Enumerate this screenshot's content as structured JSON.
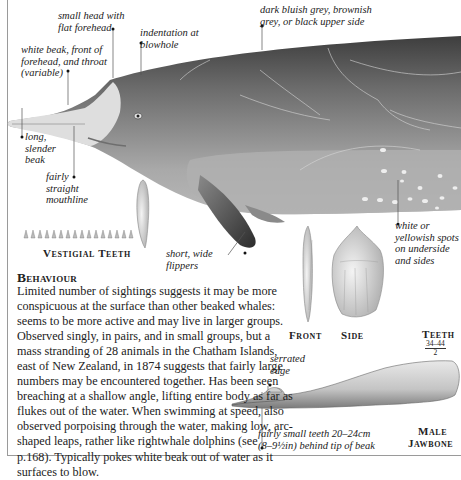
{
  "callouts": {
    "small_head": "small head with\nflat forehead",
    "blowhole": "indentation at\nblowhole",
    "upper_side": "dark bluish grey, brownish\ngrey, or black upper side",
    "white_beak": "white beak, front of\nforehead, and throat\n(variable)",
    "long_beak": "long,\nslender\nbeak",
    "mouthline": "fairly\nstraight\nmouthline",
    "flippers": "short, wide\nflippers",
    "spots": "white or\nyellowish spots\non underside\nand sides",
    "serrated_edge": "serrated\nedge",
    "teeth_position": "fairly small teeth 20–24cm\n(8–9½in) behind tip of beak"
  },
  "captions": {
    "vestigial_teeth": "Vestigial Teeth",
    "front": "Front",
    "side": "Side",
    "teeth_label": "Teeth",
    "teeth_numerator": "34–44",
    "teeth_denominator": "2",
    "male_jawbone_line1": "Male",
    "male_jawbone_line2": "Jawbone"
  },
  "behaviour": {
    "heading": "Behaviour",
    "text": "Limited number of sightings suggests it may be more conspicuous at the surface than other beaked whales: seems to be more active and may live in larger groups. Observed singly, in pairs, and in small groups, but a mass stranding of 28 animals in the Chatham Islands, east of New Zealand, in 1874 suggests that fairly large numbers may be encountered together. Has been seen breaching at a shallow angle, lifting entire body as far as flukes out of the water. When swimming at speed, also observed porpoising through the water, making low, arc-shaped leaps, rather like rightwhale dolphins (see p.168). Typically pokes white beak out of water as it surfaces to blow."
  },
  "colors": {
    "dark_back": "#4a4a4a",
    "mid_body": "#8c8c8c",
    "light_belly": "#b5b5b5",
    "beak": "#dcdcdc",
    "frame": "#9a9a9a"
  }
}
